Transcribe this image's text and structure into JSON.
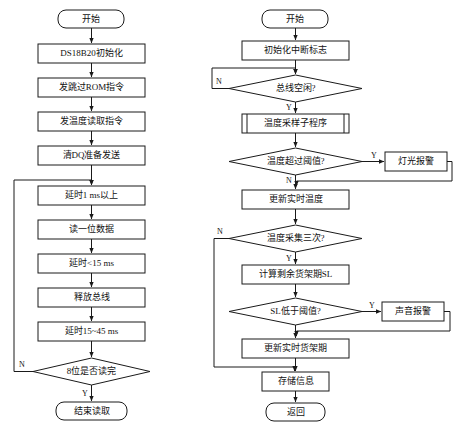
{
  "diagram": {
    "background_color": "#ffffff",
    "line_color": "#1a1a1a",
    "text_color": "#111111",
    "left_flow": {
      "name": "DS18B20 read-bit flow",
      "nodes": [
        {
          "id": "l1",
          "type": "terminator",
          "label": "开始"
        },
        {
          "id": "l2",
          "type": "process",
          "label": "DS18B20初始化"
        },
        {
          "id": "l3",
          "type": "process",
          "label": "发跳过ROM指令"
        },
        {
          "id": "l4",
          "type": "process",
          "label": "发温度读取指令"
        },
        {
          "id": "l5",
          "type": "process",
          "label": "清DQ准备发送"
        },
        {
          "id": "l6",
          "type": "process",
          "label": "延时1 ms以上"
        },
        {
          "id": "l7",
          "type": "process",
          "label": "读一位数据"
        },
        {
          "id": "l8",
          "type": "process",
          "label": "延时<15 ms"
        },
        {
          "id": "l9",
          "type": "process",
          "label": "释放总线"
        },
        {
          "id": "l10",
          "type": "process",
          "label": "延时15~45 ms"
        },
        {
          "id": "l11",
          "type": "decision",
          "label": "8位是否读完"
        },
        {
          "id": "l12",
          "type": "terminator",
          "label": "结束读取"
        }
      ],
      "edge_labels": {
        "loop_back": "N",
        "exit": "Y"
      }
    },
    "right_flow": {
      "name": "Main monitoring flow",
      "nodes": [
        {
          "id": "r1",
          "type": "terminator",
          "label": "开始"
        },
        {
          "id": "r2",
          "type": "process",
          "label": "初始化中断标志"
        },
        {
          "id": "r3",
          "type": "decision",
          "label": "总线空闲?"
        },
        {
          "id": "r4",
          "type": "subroutine",
          "label": "温度采样子程序"
        },
        {
          "id": "r5",
          "type": "decision",
          "label": "温度超过阈值?"
        },
        {
          "id": "r6",
          "type": "process",
          "label": "灯光报警"
        },
        {
          "id": "r7",
          "type": "process",
          "label": "更新实时温度"
        },
        {
          "id": "r8",
          "type": "decision",
          "label": "温度采集三次?"
        },
        {
          "id": "r9",
          "type": "process",
          "label": "计算剩余货架期SL"
        },
        {
          "id": "r10",
          "type": "decision",
          "label": "SL低于阈值?"
        },
        {
          "id": "r11",
          "type": "process",
          "label": "声音报警"
        },
        {
          "id": "r12",
          "type": "process",
          "label": "更新实时货架期"
        },
        {
          "id": "r13",
          "type": "process",
          "label": "存储信息"
        },
        {
          "id": "r14",
          "type": "terminator",
          "label": "返回"
        }
      ],
      "edge_labels": {
        "bus_idle_no": "N",
        "bus_idle_yes": "Y",
        "temp_over_yes": "Y",
        "temp_over_no": "N",
        "sample_three_no": "N",
        "sample_three_yes": "Y",
        "sl_low_yes": "Y"
      }
    }
  }
}
